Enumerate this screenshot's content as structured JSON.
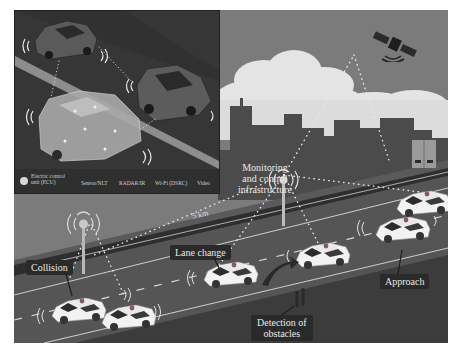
{
  "figure": {
    "colors": {
      "sky": "#7b7b7b",
      "cloud": "#e6e6e6",
      "building": "#4a4a4a",
      "road": "#545454",
      "road_edge": "#2e2e2e",
      "car_body": "#f2f2f2",
      "label_bg": "#2a2a2a",
      "inset_bg": "#3a3a3a"
    }
  },
  "inset": {
    "legend": {
      "ecu": "Electric control unit (ECU)",
      "ecu_line1": "Electric control",
      "ecu_line2": "unit (ECU)",
      "sensor": "Sensor/NLT",
      "radar": "RADAR/IR",
      "wifi": "Wi-Fi (DSRC)",
      "video": "Video"
    }
  },
  "annotations": {
    "monitoring_line1": "Monitoring",
    "monitoring_line2": "and control",
    "monitoring_line3": "infrastructure",
    "distance": "5 km",
    "lane_change": "Lane change",
    "collision": "Collision",
    "approach": "Approach",
    "detection_line1": "Detection of",
    "detection_line2": "obstacles"
  },
  "icons": [
    "satellite-icon",
    "cell-tower-icon",
    "server-cabinet-icon",
    "car-icon",
    "pedestrian-icon",
    "signal-wave-icon"
  ]
}
